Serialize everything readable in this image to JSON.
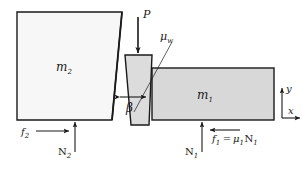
{
  "figure": {
    "type": "free-body-diagram",
    "title": "",
    "colors": {
      "stroke": "#1a1a1a",
      "block_m1_fill": "#d8d8d8",
      "block_m2_fill": "#f7f7f7",
      "wedge_fill": "#dcdcdc",
      "background": "#ffffff"
    },
    "bodies": [
      {
        "name": "block-m2",
        "label": "m",
        "label_sub": "2",
        "shape": "quadrilateral-slanted-right-edge",
        "fill": "#f7f7f7"
      },
      {
        "name": "wedge",
        "label": "",
        "shape": "trapezoid-narrow-bottom",
        "fill": "#dcdcdc"
      },
      {
        "name": "block-m1",
        "label": "m",
        "label_sub": "1",
        "shape": "rectangle",
        "fill": "#d8d8d8"
      }
    ],
    "forces": [
      {
        "name": "applied-load-P",
        "label": "P",
        "direction": "down"
      },
      {
        "name": "friction-f2",
        "label": "f",
        "label_sub": "2",
        "direction": "right"
      },
      {
        "name": "normal-N2",
        "label": "N",
        "label_sub": "2",
        "direction": "up"
      },
      {
        "name": "normal-N1",
        "label": "N",
        "label_sub": "1",
        "direction": "up"
      },
      {
        "name": "friction-f1",
        "label": "f",
        "label_sub": "1",
        "equals": "=",
        "expr_mu": "μ",
        "expr_mu_sub": "1",
        "expr_N": "N",
        "expr_N_sub": "1",
        "direction": "left"
      }
    ],
    "annotations": [
      {
        "name": "wall-friction-coefficient",
        "label": "μ",
        "label_sub": "w"
      },
      {
        "name": "wedge-angle",
        "label": "β"
      }
    ],
    "axes": {
      "name": "coordinate-axes",
      "x_label": "x",
      "y_label": "y"
    }
  }
}
